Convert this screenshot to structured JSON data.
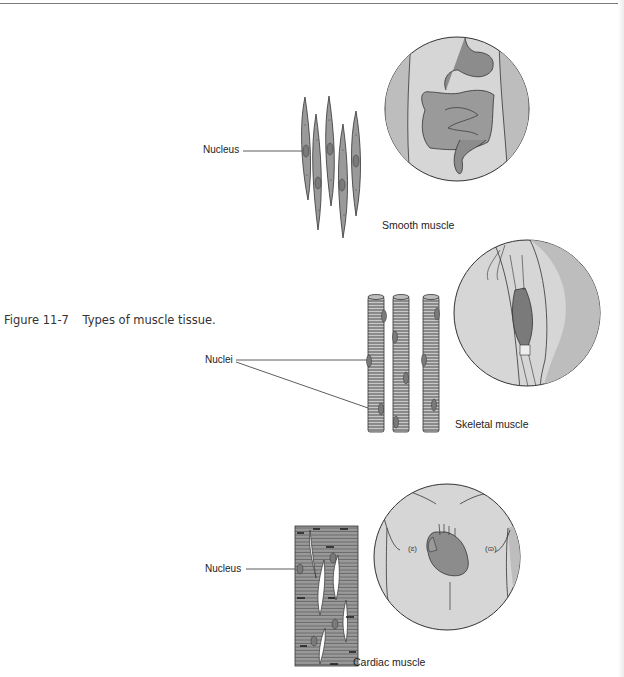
{
  "page": {
    "header_fragment": "… Anatomy and Physiology … Pharmacy …"
  },
  "figure": {
    "number": "Figure 11-7",
    "caption": "Types of muscle tissue.",
    "panels": [
      {
        "id": "smooth",
        "title": "Smooth muscle",
        "pointer_label": "Nucleus",
        "inset": "abdomen-digestive-tract"
      },
      {
        "id": "skeletal",
        "title": "Skeletal muscle",
        "pointer_label": "Nuclei",
        "inset": "upper-arm-biceps"
      },
      {
        "id": "cardiac",
        "title": "Cardiac muscle",
        "pointer_label": "Nucleus",
        "inset": "chest-heart"
      }
    ]
  },
  "colors": {
    "cell_fill": "#9a9a9a",
    "inset_fill": "#d6d6d6",
    "inset_side": "#bdbdbd",
    "organ_fill": "#8c8c8c",
    "line": "#333333"
  }
}
